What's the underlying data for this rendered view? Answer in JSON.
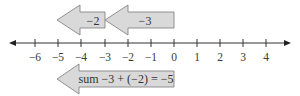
{
  "diagram": {
    "type": "number_line_addition",
    "colors": {
      "axis": "#333333",
      "arrow_fill": "#d9d9d9",
      "arrow_stroke": "#7a7a7a",
      "text": "#333333"
    },
    "axis": {
      "min": -6,
      "max": 4,
      "tick_labels": [
        "−6",
        "−5",
        "−4",
        "−3",
        "−2",
        "−1",
        "0",
        "1",
        "2",
        "3",
        "4"
      ]
    },
    "arrows": [
      {
        "label": "−2",
        "from": -3,
        "to": -5,
        "row": "top"
      },
      {
        "label": "−3",
        "from": 0,
        "to": -3,
        "row": "top"
      },
      {
        "label": "sum −3 + (−2) = −5",
        "from": 0,
        "to": -5,
        "row": "bottom"
      }
    ]
  }
}
